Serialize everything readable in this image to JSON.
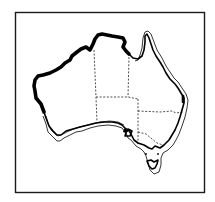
{
  "figure": {
    "title": "Australia distribution map",
    "region": "Australia",
    "colors": {
      "background": "#ffffff",
      "ink": "#000000",
      "frame": "#1a1a1a"
    },
    "legend_meaning": {
      "thick_coastline": "Range along northern and western coasts",
      "double_outline_band": "Range along eastern and southern coasts",
      "dashed_lines": "State and territory borders"
    },
    "regions": [
      {
        "name": "Western Australia"
      },
      {
        "name": "Northern Territory"
      },
      {
        "name": "South Australia"
      },
      {
        "name": "Queensland"
      },
      {
        "name": "New South Wales"
      },
      {
        "name": "Victoria"
      },
      {
        "name": "Tasmania"
      }
    ]
  }
}
